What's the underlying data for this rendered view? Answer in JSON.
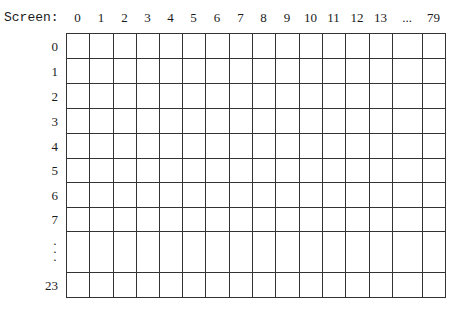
{
  "diagram": {
    "screen_label": "Screen:",
    "column_labels": [
      "0",
      "1",
      "2",
      "3",
      "4",
      "5",
      "6",
      "7",
      "8",
      "9",
      "10",
      "11",
      "12",
      "13",
      "...",
      "79"
    ],
    "row_labels": [
      "0",
      "1",
      "2",
      "3",
      "4",
      "5",
      "6",
      "7",
      ":",
      "23"
    ],
    "ellipsis_row_glyph": "⋮",
    "line_color": "#333333"
  }
}
